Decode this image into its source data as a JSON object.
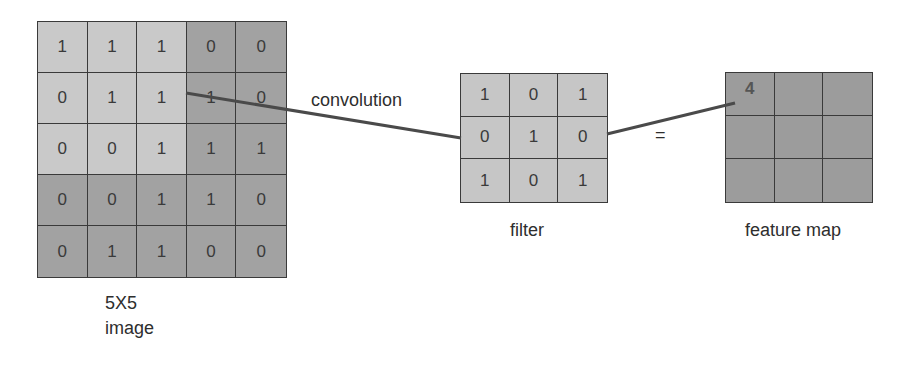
{
  "image": {
    "caption_line1": "5X5",
    "caption_line2": "image",
    "values": [
      [
        1,
        1,
        1,
        0,
        0
      ],
      [
        0,
        1,
        1,
        1,
        0
      ],
      [
        0,
        0,
        1,
        1,
        1
      ],
      [
        0,
        0,
        1,
        1,
        0
      ],
      [
        0,
        1,
        1,
        0,
        0
      ]
    ],
    "highlight_window": "top-left 3x3"
  },
  "filter": {
    "caption": "filter",
    "values": [
      [
        1,
        0,
        1
      ],
      [
        0,
        1,
        0
      ],
      [
        1,
        0,
        1
      ]
    ]
  },
  "feature_map": {
    "caption": "feature map",
    "values": [
      [
        "4",
        "",
        ""
      ],
      [
        "",
        "",
        ""
      ],
      [
        "",
        "",
        ""
      ]
    ]
  },
  "operation_label": "convolution",
  "equals_label": "=",
  "colors": {
    "light_cell": "#c9c9c9",
    "dark_cell": "#a2a2a2",
    "filter_cell": "#c6c6c6",
    "map_cell": "#9c9c9c",
    "line": "#4a4a4a"
  }
}
